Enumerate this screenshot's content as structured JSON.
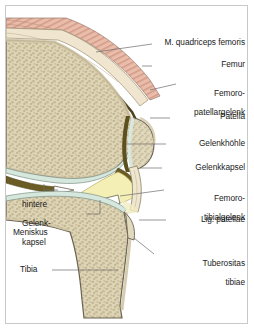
{
  "figure": {
    "type": "anatomical-illustration",
    "region": "knee-joint-sagittal-section",
    "language": "de"
  },
  "palette": {
    "frame_border": "#c9c9c9",
    "background": "#ffffff",
    "muscle": "#e7b9a6",
    "muscle_stripe": "#cf9280",
    "tendon": "#efe3cb",
    "cortical_bone": "#e4dcc4",
    "trabecular_bone": "#ddd4b6",
    "trabecular_speck": "#bdb08a",
    "cartilage": "#d8e8de",
    "capsule": "#6b5c24",
    "joint_cavity": "#f4efb4",
    "meniscus": "#ffffff",
    "outline": "#6a6252",
    "leader_line": "#6b6b6b",
    "text": "#1a1a1a"
  },
  "labels": {
    "right": [
      {
        "id": "m-quadriceps-femoris",
        "text": "M. quadriceps femoris",
        "lines": [
          "M. quadriceps femoris"
        ]
      },
      {
        "id": "femur",
        "text": "Femur",
        "lines": [
          "Femur"
        ]
      },
      {
        "id": "femoropatellargelenk",
        "text": "Femoro-patellargelenk",
        "lines": [
          "Femoro-",
          "patellargelenk"
        ]
      },
      {
        "id": "patella",
        "text": "Patella",
        "lines": [
          "Patella"
        ]
      },
      {
        "id": "gelenkhoehle",
        "text": "Gelenkhöhle",
        "lines": [
          "Gelenkhöhle"
        ]
      },
      {
        "id": "gelenkkapsel",
        "text": "Gelenkkapsel",
        "lines": [
          "Gelenkkapsel"
        ]
      },
      {
        "id": "femorotibialgelenk",
        "text": "Femoro-tibialgelenk",
        "lines": [
          "Femoro-",
          "tibialgelenk"
        ]
      },
      {
        "id": "lig-patellae",
        "text": "Lig. patellae",
        "lines": [
          "Lig. patellae"
        ]
      },
      {
        "id": "tuberositas-tibiae",
        "text": "Tuberositas tibiae",
        "lines": [
          "Tuberositas",
          "tibiae"
        ]
      }
    ],
    "left": [
      {
        "id": "hintere-gelenkkapsel",
        "text": "hintere Gelenk-kapsel",
        "lines": [
          "hintere",
          "Gelenk-",
          "kapsel"
        ]
      },
      {
        "id": "meniskus",
        "text": "Meniskus",
        "lines": [
          "Meniskus"
        ]
      },
      {
        "id": "tibia",
        "text": "Tibia",
        "lines": [
          "Tibia"
        ]
      }
    ]
  }
}
